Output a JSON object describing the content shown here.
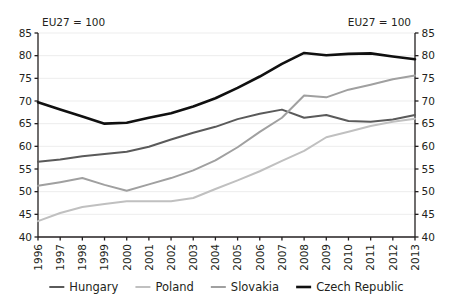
{
  "chart_data": {
    "type": "line",
    "title": "",
    "subtitle": "",
    "xlabel": "",
    "ylabel": "",
    "note_left": "EU27 = 100",
    "note_right": "EU27 = 100",
    "grid": true,
    "legend_position": "bottom",
    "ylim": [
      40,
      85
    ],
    "yticks": [
      40,
      45,
      50,
      55,
      60,
      65,
      70,
      75,
      80,
      85
    ],
    "ytick_labels": [
      "40",
      "45",
      "50",
      "55",
      "60",
      "65",
      "70",
      "75",
      "80",
      "85"
    ],
    "dual_axis": true,
    "categories": [
      1996,
      1997,
      1998,
      1999,
      2000,
      2001,
      2002,
      2003,
      2004,
      2005,
      2006,
      2007,
      2008,
      2009,
      2010,
      2011,
      2012,
      2013
    ],
    "xtick_labels": [
      "1996",
      "1997",
      "1998",
      "1999",
      "2000",
      "2001",
      "2002",
      "2003",
      "2004",
      "2005",
      "2006",
      "2007",
      "2008",
      "2009",
      "2010",
      "2011",
      "2012",
      "2013"
    ],
    "series": [
      {
        "name": "Hungary",
        "color": "#5a5a5a",
        "width": 2.0,
        "values": [
          56.6,
          57.1,
          57.8,
          58.3,
          58.8,
          59.9,
          61.5,
          63.0,
          64.3,
          66.0,
          67.2,
          68.1,
          66.3,
          66.9,
          65.6,
          65.4,
          65.9,
          66.9
        ]
      },
      {
        "name": "Poland",
        "color": "#c0c0c0",
        "width": 2.0,
        "values": [
          43.5,
          45.3,
          46.6,
          47.3,
          47.9,
          47.9,
          47.9,
          48.6,
          50.6,
          52.5,
          54.5,
          56.8,
          59.0,
          62.0,
          63.2,
          64.5,
          65.4,
          66.1
        ]
      },
      {
        "name": "Slovakia",
        "color": "#a0a0a0",
        "width": 2.0,
        "values": [
          51.3,
          52.1,
          53.0,
          51.5,
          50.2,
          51.6,
          53.0,
          54.7,
          56.9,
          59.8,
          63.2,
          66.3,
          71.2,
          70.8,
          72.5,
          73.6,
          74.8,
          75.6
        ]
      },
      {
        "name": "Czech Republic",
        "color": "#101010",
        "width": 2.6,
        "values": [
          69.7,
          68.1,
          66.6,
          65.0,
          65.2,
          66.3,
          67.3,
          68.8,
          70.6,
          72.9,
          75.4,
          78.2,
          80.6,
          80.1,
          80.4,
          80.5,
          79.8,
          79.2
        ]
      }
    ],
    "legend": [
      {
        "label": "Hungary",
        "color": "#5a5a5a",
        "width": 2.0
      },
      {
        "label": "Poland",
        "color": "#c0c0c0",
        "width": 2.0
      },
      {
        "label": "Slovakia",
        "color": "#a0a0a0",
        "width": 2.0
      },
      {
        "label": "Czech Republic",
        "color": "#101010",
        "width": 2.6
      }
    ],
    "axis_color": "#231f20",
    "grid_color": "#ededed",
    "background": "#ffffff"
  }
}
